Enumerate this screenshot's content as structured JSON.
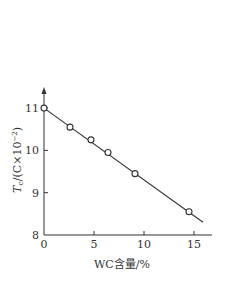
{
  "chart_data": {
    "type": "scatter",
    "title": "",
    "xlabel": "WC含量/%",
    "ylabel": {
      "main": "T",
      "sub": "c",
      "rest": "/(C×10",
      "sup": "−2",
      "close": ")"
    },
    "xlim": [
      0,
      16
    ],
    "ylim": [
      8,
      11.5
    ],
    "xticks": [
      0,
      5,
      10,
      15
    ],
    "yticks": [
      8,
      9,
      10,
      11
    ],
    "xtick_labels": [
      "0",
      "5",
      "10",
      "15"
    ],
    "ytick_labels": [
      "8",
      "9",
      "10",
      "11"
    ],
    "grid": false,
    "legend": "none",
    "series": [
      {
        "name": "measured",
        "marker": "open-circle",
        "x": [
          0,
          2.6,
          4.7,
          6.4,
          9.1,
          14.5
        ],
        "y": [
          11.0,
          10.55,
          10.25,
          9.95,
          9.45,
          8.55
        ]
      }
    ],
    "fit_line": {
      "x": [
        0,
        15.9
      ],
      "y": [
        11.0,
        8.3
      ]
    },
    "colors": {
      "line": "#333333",
      "marker_fill": "#ffffff",
      "text": "#333333"
    }
  }
}
